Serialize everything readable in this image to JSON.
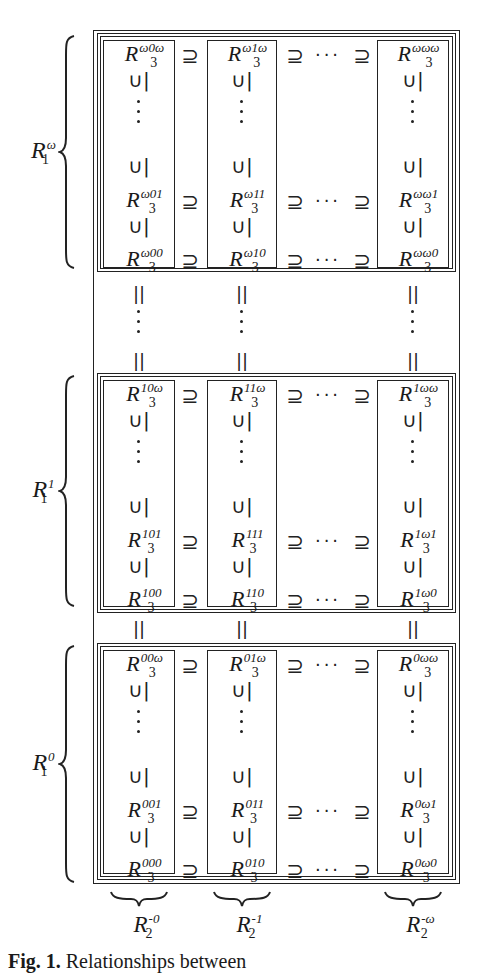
{
  "figure": {
    "caption_label": "Fig. 1.",
    "caption_text": "Relationships between",
    "groups": [
      {
        "label_base": "R",
        "label_sub": "1",
        "label_sup": "ω",
        "rows": [
          [
            "ω0ω",
            "ω1ω",
            "ωωω"
          ],
          [
            "ω01",
            "ω11",
            "ωω1"
          ],
          [
            "ω00",
            "ω10",
            "ωω0"
          ]
        ]
      },
      {
        "label_base": "R",
        "label_sub": "1",
        "label_sup": "1",
        "rows": [
          [
            "10ω",
            "11ω",
            "1ωω"
          ],
          [
            "101",
            "111",
            "1ω1"
          ],
          [
            "100",
            "110",
            "1ω0"
          ]
        ]
      },
      {
        "label_base": "R",
        "label_sub": "1",
        "label_sup": "0",
        "rows": [
          [
            "00ω",
            "01ω",
            "0ωω"
          ],
          [
            "001",
            "011",
            "0ω1"
          ],
          [
            "000",
            "010",
            "0ω0"
          ]
        ]
      }
    ],
    "cell_base": "R",
    "cell_sub": "3",
    "bottom_labels": [
      {
        "base": "R",
        "sub": "2",
        "sup": "-0"
      },
      {
        "base": "R",
        "sub": "2",
        "sup": "-1"
      },
      {
        "base": "R",
        "sub": "2",
        "sup": "-ω"
      }
    ],
    "symbols": {
      "supseteq": "⊇",
      "subseteq_rot": "∪|",
      "equals_rot": "||",
      "hdots": "···",
      "left_brace": "{"
    }
  }
}
